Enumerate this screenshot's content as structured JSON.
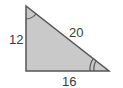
{
  "diagram": {
    "type": "right-triangle",
    "fill_color": "#c9c9c9",
    "stroke_color": "#555555",
    "labels": {
      "vertical_leg": "12",
      "hypotenuse": "20",
      "horizontal_leg": "16"
    },
    "angle_marks": {
      "top_vertex": "single-arc",
      "bottom_right_vertex": "double-arc"
    }
  }
}
